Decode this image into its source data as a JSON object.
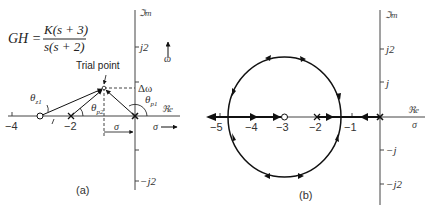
{
  "panel_a": {
    "caption": "(a)",
    "formula": {
      "lhs": "GH =",
      "numerator": "K(s + 3)",
      "denominator": "s(s + 2)"
    },
    "axis_labels": {
      "imag": "ℑm",
      "real": "ℜe",
      "sigma": "σ",
      "omega": "ω"
    },
    "tick_labels": {
      "j2": "j2",
      "neg_j2": "−j2",
      "neg4": "−4",
      "neg2": "−2"
    },
    "annotations": {
      "trial_point": "Trial point",
      "delta_omega": "Δω",
      "sigma_dim": "σ",
      "theta_z1": "θ",
      "theta_z1_sub": "z1",
      "theta_p1": "θ",
      "theta_p1_sub": "p1",
      "theta_p2": "θ",
      "theta_p2_sub": "p2"
    },
    "poles": [
      0,
      -2
    ],
    "zeros": [
      -3
    ]
  },
  "panel_b": {
    "caption": "(b)",
    "axis_labels": {
      "imag": "ℑm",
      "real": "ℜe",
      "sigma": "σ"
    },
    "tick_labels": {
      "j2": "j2",
      "j": "j",
      "neg_j": "−j",
      "neg_j2": "−j2",
      "neg5": "−5",
      "neg4": "−4",
      "neg3": "−3",
      "neg2": "−2",
      "neg1": "−1"
    },
    "poles": [
      0,
      -2
    ],
    "zeros": [
      -3
    ],
    "locus_circle": {
      "center": -3,
      "radius": 1.732
    }
  }
}
